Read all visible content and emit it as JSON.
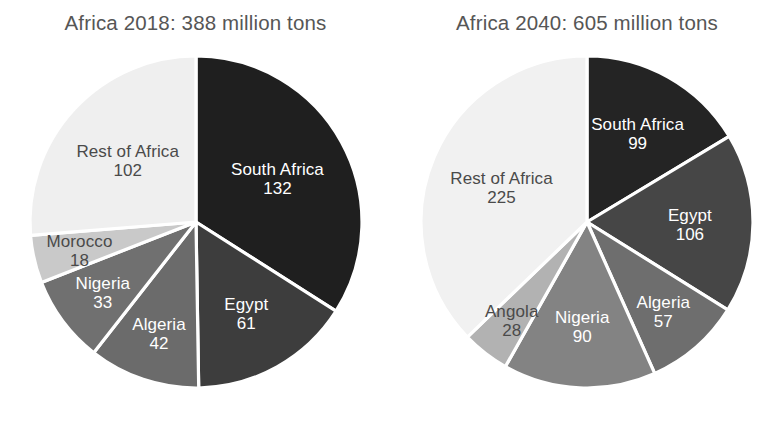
{
  "chart_data": [
    {
      "type": "pie",
      "title": "Africa 2018: 388 million tons",
      "total": 388,
      "unit": "million tons",
      "year": "2018",
      "region": "Africa",
      "legend_position": "inside-slices",
      "start_angle_deg": 0,
      "direction": "clockwise",
      "slices": [
        {
          "label": "South Africa",
          "value": 132,
          "color": "#1f1f1f",
          "text_color": "light"
        },
        {
          "label": "Egypt",
          "value": 61,
          "color": "#3d3d3d",
          "text_color": "light"
        },
        {
          "label": "Algeria",
          "value": 42,
          "color": "#6b6b6b",
          "text_color": "light"
        },
        {
          "label": "Nigeria",
          "value": 33,
          "color": "#707070",
          "text_color": "light"
        },
        {
          "label": "Morocco",
          "value": 18,
          "color": "#c9c9c9",
          "text_color": "dark"
        },
        {
          "label": "Rest of Africa",
          "value": 102,
          "color": "#efefef",
          "text_color": "dark"
        }
      ]
    },
    {
      "type": "pie",
      "title": "Africa 2040: 605 million tons",
      "total": 605,
      "unit": "million tons",
      "year": "2040",
      "region": "Africa",
      "legend_position": "inside-slices",
      "start_angle_deg": 0,
      "direction": "clockwise",
      "slices": [
        {
          "label": "South Africa",
          "value": 99,
          "color": "#242424",
          "text_color": "light"
        },
        {
          "label": "Egypt",
          "value": 106,
          "color": "#464646",
          "text_color": "light"
        },
        {
          "label": "Algeria",
          "value": 57,
          "color": "#6e6e6e",
          "text_color": "light"
        },
        {
          "label": "Nigeria",
          "value": 90,
          "color": "#838383",
          "text_color": "light"
        },
        {
          "label": "Angola",
          "value": 28,
          "color": "#b2b2b2",
          "text_color": "dark"
        },
        {
          "label": "Rest of Africa",
          "value": 225,
          "color": "#f1f1f1",
          "text_color": "dark"
        }
      ]
    }
  ],
  "figure": {
    "background_color": "#ffffff",
    "title_color": "#565656",
    "slice_separator_color": "#ffffff"
  }
}
